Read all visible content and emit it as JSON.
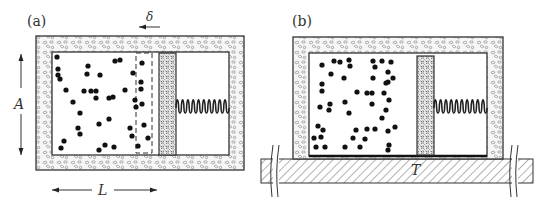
{
  "panels": [
    {
      "id": "a",
      "label": "(a)",
      "outer": [
        36,
        36,
        208,
        134
      ],
      "inner": [
        52,
        52,
        177,
        103
      ],
      "piston": [
        159,
        53,
        17,
        102
      ],
      "dashed_box": [
        136,
        53,
        16,
        100
      ],
      "spring": {
        "x1": 176,
        "x2": 229,
        "y": 108,
        "coils": 10,
        "amp": 11
      },
      "particles": [
        [
          57,
          57
        ],
        [
          58,
          69
        ],
        [
          58,
          75
        ],
        [
          60,
          79
        ],
        [
          66,
          90
        ],
        [
          73,
          102
        ],
        [
          84,
          91
        ],
        [
          80,
          113
        ],
        [
          78,
          128
        ],
        [
          80,
          134
        ],
        [
          61,
          148
        ],
        [
          64,
          141
        ],
        [
          88,
          66
        ],
        [
          87,
          74
        ],
        [
          100,
          75
        ],
        [
          91,
          91
        ],
        [
          96,
          91
        ],
        [
          96,
          98
        ],
        [
          99,
          124
        ],
        [
          99,
          150
        ],
        [
          105,
          145
        ],
        [
          109,
          98
        ],
        [
          113,
          97
        ],
        [
          109,
          119
        ],
        [
          115,
          61
        ],
        [
          120,
          60
        ],
        [
          114,
          147
        ],
        [
          125,
          90
        ],
        [
          130,
          128
        ],
        [
          132,
          136
        ],
        [
          133,
          73
        ],
        [
          135,
          100
        ],
        [
          136,
          107
        ],
        [
          142,
          63
        ],
        [
          141,
          82
        ],
        [
          141,
          89
        ],
        [
          142,
          104
        ],
        [
          144,
          125
        ],
        [
          148,
          138
        ],
        [
          138,
          146
        ]
      ],
      "dimensions": {
        "delta_label": "δ",
        "A_label": "A",
        "L_label": "L"
      }
    },
    {
      "id": "b",
      "label": "(b)",
      "outer": [
        293,
        37,
        210,
        122
      ],
      "inner": [
        309,
        53,
        178,
        103
      ],
      "piston": [
        417,
        56,
        17,
        99
      ],
      "spring": {
        "x1": 434,
        "x2": 487,
        "y": 108,
        "coils": 10,
        "amp": 11
      },
      "particles": [
        [
          322,
          65
        ],
        [
          334,
          61
        ],
        [
          340,
          62
        ],
        [
          331,
          74
        ],
        [
          322,
          84
        ],
        [
          322,
          91
        ],
        [
          320,
          107
        ],
        [
          330,
          104
        ],
        [
          329,
          110
        ],
        [
          318,
          126
        ],
        [
          314,
          138
        ],
        [
          323,
          130
        ],
        [
          321,
          137
        ],
        [
          325,
          147
        ],
        [
          316,
          147
        ],
        [
          349,
          60
        ],
        [
          350,
          66
        ],
        [
          344,
          78
        ],
        [
          357,
          92
        ],
        [
          349,
          113
        ],
        [
          345,
          102
        ],
        [
          360,
          147
        ],
        [
          373,
          61
        ],
        [
          375,
          67
        ],
        [
          373,
          78
        ],
        [
          372,
          93
        ],
        [
          367,
          93
        ],
        [
          372,
          104
        ],
        [
          382,
          61
        ],
        [
          391,
          62
        ],
        [
          388,
          72
        ],
        [
          388,
          82
        ],
        [
          386,
          83
        ],
        [
          393,
          78
        ],
        [
          384,
          93
        ],
        [
          389,
          100
        ],
        [
          386,
          110
        ],
        [
          382,
          118
        ],
        [
          388,
          131
        ],
        [
          395,
          127
        ],
        [
          389,
          145
        ],
        [
          388,
          150
        ],
        [
          375,
          129
        ],
        [
          367,
          129
        ],
        [
          356,
          130
        ],
        [
          365,
          139
        ],
        [
          353,
          138
        ],
        [
          345,
          147
        ]
      ],
      "reservoir": {
        "rect": [
          261,
          159,
          272,
          24
        ],
        "label": "T",
        "breaks": [
          276,
          515
        ]
      }
    }
  ],
  "colors": {
    "stroke": "#333333",
    "insulation_fill": "#f3f3f3",
    "particle": "#111111",
    "piston_fill": "#e4e4e4"
  }
}
